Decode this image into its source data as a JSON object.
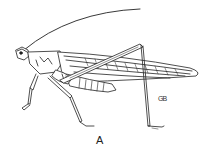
{
  "figure": {
    "label": "A",
    "signature": "GB",
    "stroke_color": "#222222",
    "background": "#ffffff"
  }
}
